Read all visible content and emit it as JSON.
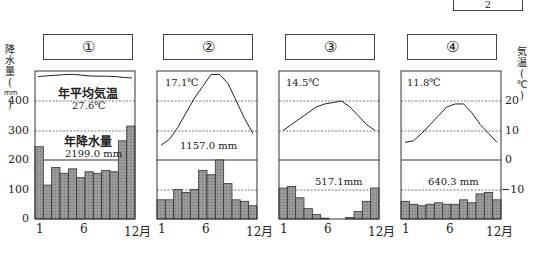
{
  "page_number": "2",
  "left_axis": {
    "title_chars": [
      "降",
      "水",
      "量",
      "(",
      "mm",
      ")"
    ],
    "ticks": [
      "400",
      "300",
      "200",
      "100",
      "0"
    ]
  },
  "right_axis": {
    "title_chars": [
      "気",
      "温",
      "(",
      "℃",
      ")"
    ],
    "ticks": [
      "20",
      "10",
      "0",
      "−10"
    ]
  },
  "x_ticks": [
    "1",
    "6",
    "12月"
  ],
  "panels": [
    {
      "label": "①",
      "temp_label": "年平均気温",
      "temp": "27.6℃",
      "precip_label": "年降水量",
      "precip": "2199.0 mm"
    },
    {
      "label": "②",
      "temp": "17.1℃",
      "precip": "1157.0 mm"
    },
    {
      "label": "③",
      "temp": "14.5℃",
      "precip": "517.1mm"
    },
    {
      "label": "④",
      "temp": "11.8℃",
      "precip": "640.3 mm"
    }
  ],
  "chart_data": [
    {
      "type": "bar+line",
      "title": "①",
      "categories": [
        "1",
        "2",
        "3",
        "4",
        "5",
        "6",
        "7",
        "8",
        "9",
        "10",
        "11",
        "12"
      ],
      "series": [
        {
          "name": "降水量(mm)",
          "type": "bar",
          "values": [
            245,
            115,
            175,
            155,
            170,
            140,
            160,
            155,
            165,
            160,
            265,
            315
          ]
        },
        {
          "name": "気温(℃)",
          "type": "line",
          "values": [
            27.5,
            27.7,
            27.9,
            28.1,
            28.2,
            28.0,
            27.7,
            27.6,
            27.6,
            27.5,
            27.2,
            27.0
          ]
        }
      ],
      "annual_mean_temp": 27.6,
      "annual_precip": 2199.0,
      "ylim_precip": [
        0,
        400
      ],
      "ylim_temp": [
        -20,
        20
      ]
    },
    {
      "type": "bar+line",
      "title": "②",
      "categories": [
        "1",
        "2",
        "3",
        "4",
        "5",
        "6",
        "7",
        "8",
        "9",
        "10",
        "11",
        "12"
      ],
      "series": [
        {
          "name": "降水量(mm)",
          "type": "bar",
          "values": [
            65,
            65,
            100,
            90,
            100,
            165,
            150,
            200,
            120,
            65,
            60,
            45
          ]
        },
        {
          "name": "気温(℃)",
          "type": "line",
          "values": [
            5,
            7,
            11,
            16,
            21,
            25,
            29,
            29,
            26,
            20,
            14,
            9
          ]
        }
      ],
      "annual_mean_temp": 17.1,
      "annual_precip": 1157.0
    },
    {
      "type": "bar+line",
      "title": "③",
      "categories": [
        "1",
        "2",
        "3",
        "4",
        "5",
        "6",
        "7",
        "8",
        "9",
        "10",
        "11",
        "12"
      ],
      "series": [
        {
          "name": "降水量(mm)",
          "type": "bar",
          "values": [
            105,
            110,
            72,
            35,
            15,
            3,
            0,
            0,
            5,
            25,
            60,
            105
          ]
        },
        {
          "name": "気温(℃)",
          "type": "line",
          "values": [
            10,
            12,
            14,
            16,
            18,
            19,
            19.5,
            20,
            18,
            15,
            12,
            10
          ]
        }
      ],
      "annual_mean_temp": 14.5,
      "annual_precip": 517.1
    },
    {
      "type": "bar+line",
      "title": "④",
      "categories": [
        "1",
        "2",
        "3",
        "4",
        "5",
        "6",
        "7",
        "8",
        "9",
        "10",
        "11",
        "12"
      ],
      "series": [
        {
          "name": "降水量(mm)",
          "type": "bar",
          "values": [
            60,
            50,
            45,
            50,
            55,
            50,
            50,
            65,
            55,
            85,
            90,
            65
          ]
        },
        {
          "name": "気温(℃)",
          "type": "line",
          "values": [
            6,
            6.5,
            9,
            12,
            15,
            18,
            19,
            19,
            16,
            12,
            9,
            6
          ]
        }
      ],
      "annual_mean_temp": 11.8,
      "annual_precip": 640.3
    }
  ]
}
